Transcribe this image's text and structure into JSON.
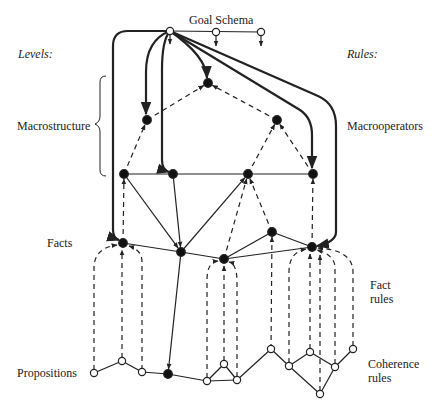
{
  "title": "Goal Schema",
  "left_heading": "Levels:",
  "right_heading": "Rules:",
  "levels": {
    "macrostructure": "Macrostructure",
    "facts": "Facts",
    "propositions": "Propositions"
  },
  "rules": {
    "macrooperators": "Macrooperators",
    "fact_rules_1": "Fact",
    "fact_rules_2": "rules",
    "coherence_rules_1": "Coherence",
    "coherence_rules_2": "rules"
  },
  "colors": {
    "ink": "#222222",
    "background": "#ffffff"
  },
  "nodes": {
    "g0": {
      "x": 170,
      "y": 31,
      "type": "open"
    },
    "g1": {
      "x": 216,
      "y": 32,
      "type": "open"
    },
    "g2": {
      "x": 261,
      "y": 32,
      "type": "open"
    },
    "m0": {
      "x": 208,
      "y": 83,
      "type": "filled"
    },
    "m1": {
      "x": 147,
      "y": 120,
      "type": "filled"
    },
    "m2": {
      "x": 277,
      "y": 120,
      "type": "filled"
    },
    "l0": {
      "x": 124,
      "y": 174,
      "type": "filled"
    },
    "l1": {
      "x": 173,
      "y": 174,
      "type": "filled"
    },
    "l2": {
      "x": 248,
      "y": 174,
      "type": "filled"
    },
    "l3": {
      "x": 313,
      "y": 174,
      "type": "filled"
    },
    "f0": {
      "x": 123,
      "y": 243,
      "type": "filled"
    },
    "f1": {
      "x": 181,
      "y": 252,
      "type": "filled"
    },
    "f2": {
      "x": 224,
      "y": 259,
      "type": "filled"
    },
    "f3": {
      "x": 272,
      "y": 232,
      "type": "filled"
    },
    "f4": {
      "x": 312,
      "y": 247,
      "type": "filled"
    },
    "p0": {
      "x": 94,
      "y": 373,
      "type": "open"
    },
    "p1": {
      "x": 122,
      "y": 361,
      "type": "open"
    },
    "p2": {
      "x": 142,
      "y": 372,
      "type": "open"
    },
    "p3": {
      "x": 168,
      "y": 374,
      "type": "filled"
    },
    "p4": {
      "x": 207,
      "y": 381,
      "type": "open"
    },
    "p5": {
      "x": 224,
      "y": 364,
      "type": "open"
    },
    "p6": {
      "x": 237,
      "y": 380,
      "type": "open"
    },
    "p7": {
      "x": 271,
      "y": 349,
      "type": "open"
    },
    "p8": {
      "x": 289,
      "y": 366,
      "type": "open"
    },
    "p9": {
      "x": 310,
      "y": 352,
      "type": "open"
    },
    "p10": {
      "x": 335,
      "y": 367,
      "type": "open"
    },
    "p11": {
      "x": 353,
      "y": 349,
      "type": "open"
    },
    "p12": {
      "x": 320,
      "y": 394,
      "type": "open"
    }
  },
  "edges": {
    "solid": [
      [
        "g0",
        "g2"
      ],
      [
        "l0",
        "l3"
      ],
      [
        "f0",
        "f1"
      ],
      [
        "f1",
        "f2"
      ],
      [
        "f2",
        "f4"
      ],
      [
        "f2",
        "f3"
      ],
      [
        "f3",
        "f4"
      ],
      [
        "p0",
        "p1"
      ],
      [
        "p1",
        "p2"
      ],
      [
        "p2",
        "p3"
      ],
      [
        "p3",
        "p4"
      ],
      [
        "p4",
        "p5"
      ],
      [
        "p5",
        "p6"
      ],
      [
        "p4",
        "p6"
      ],
      [
        "p6",
        "p7"
      ],
      [
        "p7",
        "p8"
      ],
      [
        "p8",
        "p9"
      ],
      [
        "p9",
        "p10"
      ],
      [
        "p10",
        "p11"
      ],
      [
        "p8",
        "p12"
      ],
      [
        "p12",
        "p10"
      ]
    ],
    "arrows": [
      [
        "l0",
        "f1"
      ],
      [
        "l1",
        "f1"
      ],
      [
        "f1",
        "l2"
      ],
      [
        "f1",
        "p3"
      ]
    ],
    "dashed_arrows": [
      [
        "m1",
        "m0"
      ],
      [
        "m2",
        "m0"
      ],
      [
        "l0",
        "m1"
      ],
      [
        "l2",
        "m2"
      ],
      [
        "l3",
        "m2"
      ],
      [
        "f0",
        "l0"
      ],
      [
        "f2",
        "l2"
      ],
      [
        "f3",
        "l2"
      ],
      [
        "f4",
        "l3"
      ],
      [
        "p7",
        "f3"
      ]
    ]
  }
}
